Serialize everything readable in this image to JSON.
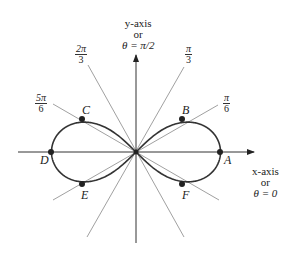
{
  "axes": {
    "y_label_line1": "y-axis",
    "y_label_line2": "or",
    "y_label_line3": "θ = π/2",
    "x_label_line1": "x-axis",
    "x_label_line2": "or",
    "x_label_line3": "θ = 0"
  },
  "angle_labels": [
    {
      "num": "2π",
      "den": "3"
    },
    {
      "num": "π",
      "den": "3"
    },
    {
      "num": "5π",
      "den": "6"
    },
    {
      "num": "π",
      "den": "6"
    }
  ],
  "points": [
    "A",
    "B",
    "C",
    "D",
    "E",
    "F"
  ],
  "colors": {
    "curve": "#333333",
    "rays": "#777777",
    "axes": "#333333"
  }
}
